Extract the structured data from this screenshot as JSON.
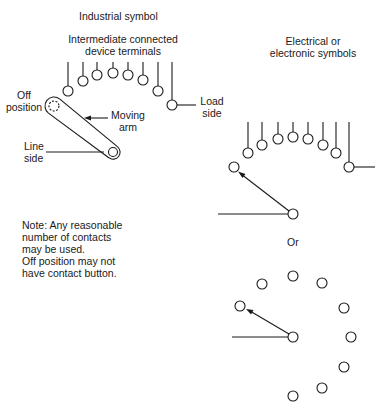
{
  "industrial": {
    "title": "Industrial symbol",
    "terminals_label_line1": "Intermediate connected",
    "terminals_label_line2": "device terminals",
    "off_position_line1": "Off",
    "off_position_line2": "position",
    "moving_arm_line1": "Moving",
    "moving_arm_line2": "arm",
    "line_side_line1": "Line",
    "line_side_line2": "side",
    "load_side_line1": "Load",
    "load_side_line2": "side"
  },
  "electrical": {
    "title_line1": "Electrical or",
    "title_line2": "electronic symbols",
    "or_label": "Or"
  },
  "note": {
    "line1": "Note: Any reasonable",
    "line2": "number of contacts",
    "line3": "may be used.",
    "line4": "Off position may not",
    "line5": "have contact button."
  },
  "colors": {
    "ink": "#1a1a1a",
    "background": "#ffffff"
  }
}
